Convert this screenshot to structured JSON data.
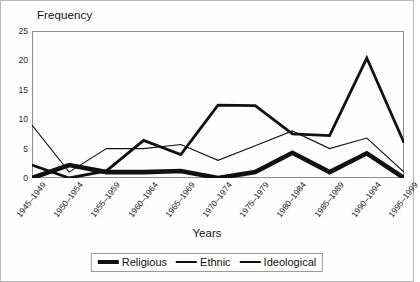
{
  "chart_data": {
    "type": "line",
    "title": "",
    "ylabel": "Frequency",
    "xlabel": "Years",
    "ylim": [
      0,
      25
    ],
    "yticks": [
      0,
      5,
      10,
      15,
      20,
      25
    ],
    "grid": false,
    "legend_position": "bottom",
    "categories": [
      "1945–1949",
      "1950–1954",
      "1955–1959",
      "1960–1964",
      "1965–1969",
      "1970–1974",
      "1975–1979",
      "1980–1984",
      "1985–1989",
      "1990–1994",
      "1995–1999"
    ],
    "series": [
      {
        "name": "Religious",
        "stroke_width": 4.6,
        "color": "#111111",
        "values": [
          0,
          2.2,
          1,
          1,
          1.2,
          0,
          1,
          4.3,
          1,
          4.2,
          0
        ]
      },
      {
        "name": "Ethnic",
        "stroke_width": 2.8,
        "color": "#111111",
        "values": [
          2.2,
          0,
          1.2,
          6.4,
          4,
          12.4,
          12.3,
          7.5,
          7.2,
          20.4,
          6
        ]
      },
      {
        "name": "Ideological",
        "stroke_width": 1.1,
        "color": "#111111",
        "values": [
          9,
          1,
          5,
          5,
          5.7,
          3,
          5.5,
          8,
          5,
          6.8,
          1
        ]
      }
    ]
  }
}
